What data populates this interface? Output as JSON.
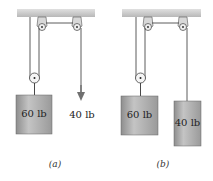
{
  "figure": {
    "panels": [
      {
        "id": "a",
        "caption": "(a)",
        "hanging_weight_label": "60 lb",
        "applied_force_label": "40 lb",
        "applied_force_type": "arrow"
      },
      {
        "id": "b",
        "caption": "(b)",
        "hanging_weight_label": "60 lb",
        "counterweight_label": "40 lb"
      }
    ],
    "colors": {
      "ceiling": "#c8c8c8",
      "block": "#a8a8a8",
      "rope": "#333333",
      "arrow": "#707070"
    }
  }
}
